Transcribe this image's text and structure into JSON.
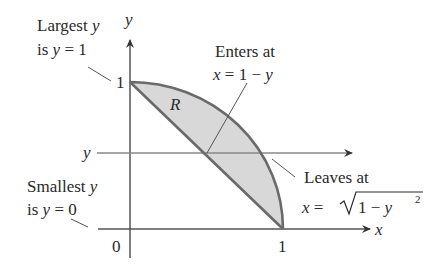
{
  "figure": {
    "type": "region-integration-diagram",
    "region_label": "R",
    "colors": {
      "region_fill": "#d8d8d8",
      "boundary": "#6a6a6a",
      "axis": "#555555",
      "text": "#2a2a2a"
    },
    "axes": {
      "x_label": "x",
      "y_label": "y",
      "origin_label": "0",
      "x_tick_label": "1",
      "y_tick_label": "1"
    },
    "horizontal_line": {
      "label": "y"
    },
    "annotations": {
      "largest_y": {
        "line1": "Largest y",
        "line2": "is y = 1"
      },
      "smallest_y": {
        "line1": "Smallest y",
        "line2": "is y = 0"
      },
      "enters_at": {
        "line1": "Enters at",
        "line2": "x = 1 − y"
      },
      "leaves_at": {
        "line1": "Leaves at",
        "line2_prefix": "x = ",
        "line2_radicand": "1 − y",
        "line2_exponent": "2"
      }
    },
    "curves": {
      "lower_boundary": "x = 1 − y",
      "upper_boundary": "x = √(1 − y²)"
    }
  }
}
